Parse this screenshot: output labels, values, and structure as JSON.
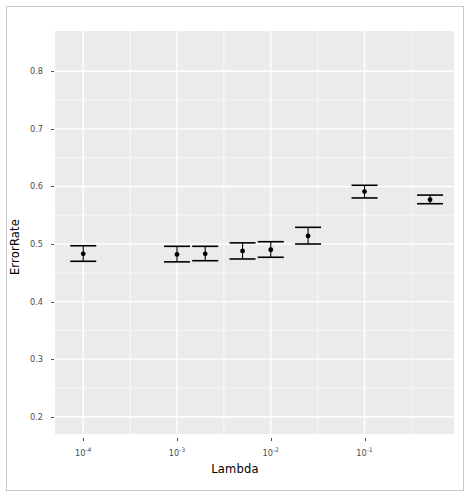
{
  "figure": {
    "width": 470,
    "height": 497,
    "panel_background": "#ebebeb",
    "gridline_major_color": "#ffffff",
    "gridline_minor_color": "#f5f5f5",
    "point_color": "#000000",
    "frame_color": "#c9c9c9",
    "tick_label_color": "#4d4d4d",
    "axis_title_color": "#000000"
  },
  "chart_data": {
    "type": "scatter",
    "title": "",
    "subtitle": "",
    "xlabel": "Lambda",
    "ylabel": "ErrorRate",
    "xscale": "log",
    "yscale": "linear",
    "xlim": [
      5e-05,
      0.9
    ],
    "ylim": [
      0.17,
      0.87
    ],
    "grid": true,
    "legend": null,
    "legend_position": "none",
    "x_tick_values": [
      0.0001,
      0.001,
      0.01,
      0.1
    ],
    "x_tick_labels": [
      "10-4",
      "10-3",
      "10-2",
      "10-1"
    ],
    "x_tick_mantissa": [
      "10",
      "10",
      "10",
      "10"
    ],
    "x_tick_exponents": [
      "-4",
      "-3",
      "-2",
      "-1"
    ],
    "y_tick_values": [
      0.2,
      0.3,
      0.4,
      0.5,
      0.6,
      0.7,
      0.8
    ],
    "y_tick_labels": [
      "0.2",
      "0.3",
      "0.4",
      "0.5",
      "0.6",
      "0.7",
      "0.8"
    ],
    "error_bars": true,
    "error_bar_type": "confidence-interval",
    "x": [
      0.0001,
      0.001,
      0.002,
      0.005,
      0.01,
      0.025,
      0.1,
      0.5
    ],
    "y": [
      0.483,
      0.482,
      0.483,
      0.488,
      0.49,
      0.514,
      0.591,
      0.577
    ],
    "y_lower": [
      0.47,
      0.469,
      0.471,
      0.474,
      0.477,
      0.5,
      0.58,
      0.57
    ],
    "y_upper": [
      0.497,
      0.496,
      0.496,
      0.502,
      0.504,
      0.529,
      0.602,
      0.585
    ],
    "points": [
      {
        "x": 0.0001,
        "y": 0.483,
        "lo": 0.47,
        "hi": 0.497
      },
      {
        "x": 0.001,
        "y": 0.482,
        "lo": 0.469,
        "hi": 0.496
      },
      {
        "x": 0.002,
        "y": 0.483,
        "lo": 0.471,
        "hi": 0.496
      },
      {
        "x": 0.005,
        "y": 0.488,
        "lo": 0.474,
        "hi": 0.502
      },
      {
        "x": 0.01,
        "y": 0.49,
        "lo": 0.477,
        "hi": 0.504
      },
      {
        "x": 0.025,
        "y": 0.514,
        "lo": 0.5,
        "hi": 0.529
      },
      {
        "x": 0.1,
        "y": 0.591,
        "lo": 0.58,
        "hi": 0.602
      },
      {
        "x": 0.5,
        "y": 0.577,
        "lo": 0.57,
        "hi": 0.585
      }
    ]
  }
}
